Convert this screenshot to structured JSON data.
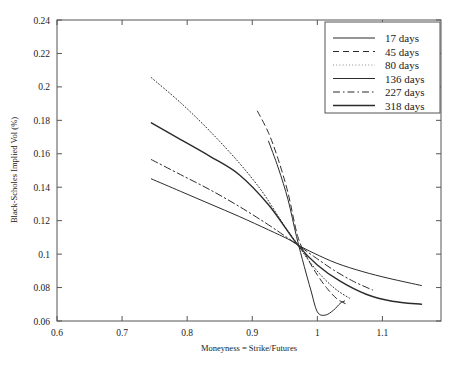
{
  "chart_data": {
    "type": "line",
    "title": "",
    "xlabel": "Moneyness = Strike/Futures",
    "ylabel": "Black-Scholes Implied Vol (%)",
    "xlim": [
      0.6,
      1.19
    ],
    "ylim": [
      0.06,
      0.24
    ],
    "xticks": [
      0.6,
      0.7,
      0.8,
      0.9,
      1.0,
      1.1
    ],
    "xticklabels": [
      "0.6",
      "0.7",
      "0.8",
      "0.9",
      "1",
      "1.1"
    ],
    "yticks": [
      0.06,
      0.08,
      0.1,
      0.12,
      0.14,
      0.16,
      0.18,
      0.2,
      0.22,
      0.24
    ],
    "yticklabels": [
      "0.06",
      "0.08",
      "0.1",
      "0.12",
      "0.14",
      "0.16",
      "0.18",
      "0.2",
      "0.22",
      "0.24"
    ],
    "grid": false,
    "legend_position": "top-right",
    "series": [
      {
        "name": "17 days",
        "label": "17 days",
        "style": "solid",
        "width": 1.0,
        "color": "#2b2b2b",
        "x": [
          0.745,
          0.79,
          0.835,
          0.88,
          0.925,
          0.955,
          0.97,
          0.995,
          1.03,
          1.07,
          1.11,
          1.16
        ],
        "y": [
          0.145,
          0.1375,
          0.13,
          0.1225,
          0.1145,
          0.109,
          0.1055,
          0.1005,
          0.0945,
          0.0895,
          0.0855,
          0.0812
        ]
      },
      {
        "name": "45 days",
        "label": "45 days",
        "style": "dashed",
        "width": 1.0,
        "color": "#2b2b2b",
        "x": [
          0.908,
          0.925,
          0.94,
          0.955,
          0.97,
          0.985,
          1.0,
          1.015,
          1.03,
          1.045
        ],
        "y": [
          0.1855,
          0.1725,
          0.1565,
          0.1365,
          0.1105,
          0.0975,
          0.0875,
          0.0795,
          0.0733,
          0.07
        ]
      },
      {
        "name": "80 days",
        "label": "80 days",
        "style": "dotted",
        "width": 1.0,
        "color": "#8a8a8a",
        "x": [
          0.745,
          0.79,
          0.835,
          0.88,
          0.915,
          0.945,
          0.97,
          0.99,
          1.01,
          1.03,
          1.05
        ],
        "y": [
          0.2055,
          0.1905,
          0.1735,
          0.1545,
          0.1375,
          0.1195,
          0.1055,
          0.0945,
          0.0855,
          0.0785,
          0.0735
        ]
      },
      {
        "name": "136 days",
        "label": "136 days",
        "style": "solid",
        "width": 1.0,
        "color": "#2b2b2b",
        "x": [
          0.925,
          0.94,
          0.955,
          0.968,
          0.98,
          0.99,
          1.0,
          1.012,
          1.025,
          1.035,
          1.042
        ],
        "y": [
          0.1675,
          0.1515,
          0.1325,
          0.1105,
          0.0925,
          0.0785,
          0.0655,
          0.0635,
          0.0665,
          0.0705,
          0.072
        ]
      },
      {
        "name": "227 days",
        "label": "227 days",
        "style": "dashdot",
        "width": 1.0,
        "color": "#2b2b2b",
        "x": [
          0.745,
          0.79,
          0.835,
          0.88,
          0.925,
          0.955,
          0.97,
          0.995,
          1.025,
          1.055,
          1.085
        ],
        "y": [
          0.1565,
          0.1475,
          0.1385,
          0.1285,
          0.1175,
          0.1095,
          0.1055,
          0.0985,
          0.0905,
          0.0838,
          0.0785
        ]
      },
      {
        "name": "318 days",
        "label": "318 days",
        "style": "solid",
        "width": 1.4,
        "color": "#2b2b2b",
        "x": [
          0.745,
          0.79,
          0.835,
          0.88,
          0.925,
          0.97,
          1.0,
          1.035,
          1.075,
          1.115,
          1.16
        ],
        "y": [
          0.1785,
          0.1685,
          0.1585,
          0.1475,
          0.1295,
          0.1055,
          0.0935,
          0.0838,
          0.076,
          0.0718,
          0.07
        ]
      }
    ]
  },
  "legend": {
    "entries": [
      {
        "label": "17 days"
      },
      {
        "label": "45 days"
      },
      {
        "label": "80 days"
      },
      {
        "label": "136 days"
      },
      {
        "label": "227 days"
      },
      {
        "label": "318 days"
      }
    ]
  }
}
